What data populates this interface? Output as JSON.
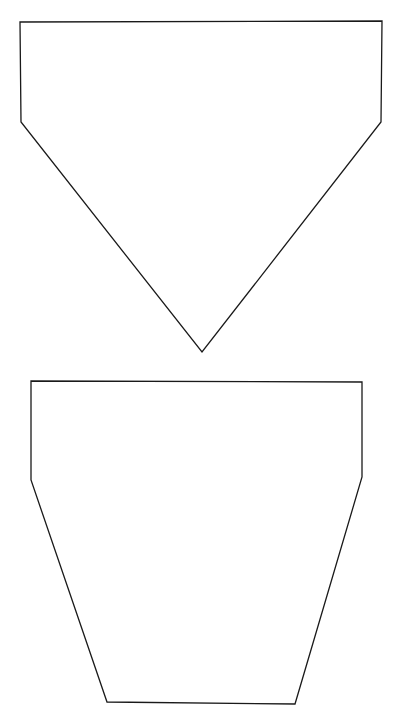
{
  "canvas": {
    "width": 395,
    "height": 720,
    "background": "#ffffff",
    "stroke_color": "#1a1a1a"
  },
  "shapes": [
    {
      "name": "pentagon-pointing-down",
      "type": "polygon",
      "points": [
        [
          20,
          22
        ],
        [
          382,
          21
        ],
        [
          381,
          122
        ],
        [
          202,
          352
        ],
        [
          21,
          122
        ]
      ]
    },
    {
      "name": "flower-pot-trapezoid",
      "type": "polygon",
      "points": [
        [
          31,
          381
        ],
        [
          362,
          382
        ],
        [
          362,
          477
        ],
        [
          295,
          704
        ],
        [
          107,
          702
        ],
        [
          31,
          480
        ]
      ]
    }
  ]
}
